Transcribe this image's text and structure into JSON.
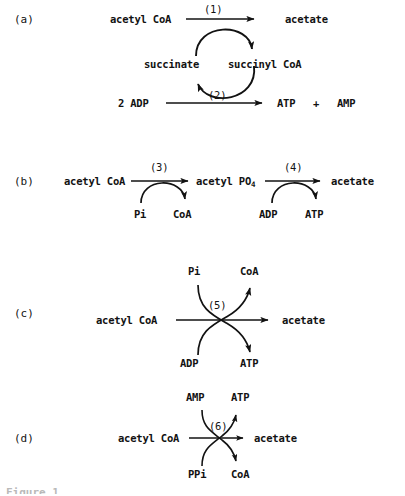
{
  "figure": {
    "type": "reaction-scheme",
    "background_color": "#ffffff",
    "ink_color": "#121212",
    "caption_partial": "Figure 1."
  },
  "panels": [
    {
      "id": "a",
      "tag": "(a)",
      "style": "cycle",
      "main_reaction": {
        "substrate": "acetyl CoA",
        "product": "acetate",
        "step": "(1)"
      },
      "secondary_reaction": {
        "substrate": "2 ADP",
        "product_1": "ATP",
        "plus": "+",
        "product_2": "AMP",
        "step": "(2)"
      },
      "cycle_intermediates": {
        "left": "succinate",
        "right": "succinyl CoA"
      }
    },
    {
      "id": "b",
      "tag": "(b)",
      "style": "two-step-linear",
      "steps": [
        {
          "step": "(3)",
          "substrate": "acetyl CoA",
          "product": "acetyl PO",
          "product_subscript": "4",
          "cosubstrate_in": "Pi",
          "cosubstrate_out": "CoA"
        },
        {
          "step": "(4)",
          "substrate": "acetyl PO4",
          "product": "acetate",
          "cosubstrate_in": "ADP",
          "cosubstrate_out": "ATP"
        }
      ]
    },
    {
      "id": "c",
      "tag": "(c)",
      "style": "crossed-arrows",
      "main_reaction": {
        "substrate": "acetyl CoA",
        "product": "acetate",
        "step": "(5)"
      },
      "cosubstrates": {
        "top_left_in": "Pi",
        "top_right_out": "CoA",
        "bottom_left_in": "ADP",
        "bottom_right_out": "ATP"
      }
    },
    {
      "id": "d",
      "tag": "(d)",
      "style": "crossed-arrows",
      "main_reaction": {
        "substrate": "acetyl CoA",
        "product": "acetate",
        "step": "(6)"
      },
      "cosubstrates": {
        "top_left_in": "AMP",
        "top_right_out": "ATP",
        "bottom_left_in": "PPi",
        "bottom_right_out": "CoA"
      }
    }
  ]
}
